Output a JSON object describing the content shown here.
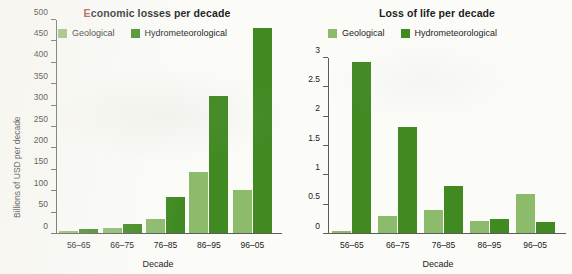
{
  "chart_data": [
    {
      "type": "bar",
      "title": "Economic losses per decade",
      "xlabel": "Decade",
      "ylabel": "Billions of USD per decade",
      "categories": [
        "56–65",
        "66–75",
        "76–85",
        "86–95",
        "96–05"
      ],
      "series": [
        {
          "name": "Geological",
          "color": "#8cbb6c",
          "values": [
            4,
            12,
            32,
            144,
            102
          ]
        },
        {
          "name": "Hydrometeorological",
          "color": "#418a22",
          "values": [
            9,
            21,
            85,
            322,
            482
          ]
        }
      ],
      "ylim": [
        0,
        500
      ],
      "ytick_values": [
        0,
        50,
        100,
        150,
        200,
        250,
        300,
        350,
        400,
        450,
        500
      ],
      "ytick_labels": [
        "0",
        "50",
        "100",
        "150",
        "200",
        "250",
        "300",
        "350",
        "400",
        "450",
        "500"
      ],
      "grid": false,
      "legend_position": "top"
    },
    {
      "type": "bar",
      "title": "Loss of life per decade",
      "xlabel": "Decade",
      "ylabel": "Millions of casualties per decade",
      "categories": [
        "56–65",
        "66–75",
        "76–85",
        "86–95",
        "96–05"
      ],
      "series": [
        {
          "name": "Geological",
          "color": "#8cbb6c",
          "values": [
            0.03,
            0.29,
            0.4,
            0.2,
            0.67
          ]
        },
        {
          "name": "Hydrometeorological",
          "color": "#418a22",
          "values": [
            2.93,
            1.81,
            0.8,
            0.24,
            0.19
          ]
        }
      ],
      "ylim": [
        0,
        3
      ],
      "ytick_values": [
        0,
        0.5,
        1,
        1.5,
        2,
        2.5,
        3
      ],
      "ytick_labels": [
        "0",
        "0.5",
        "1",
        "1.5",
        "2",
        "2.5",
        "3"
      ],
      "grid": false,
      "legend_position": "top"
    }
  ],
  "panels": {
    "left": {
      "title_lead": "E",
      "title_rest": "conomic losses per decade",
      "ylabel": "Billions of USD per decade",
      "xlabel": "Decade"
    },
    "right": {
      "title": "Loss of life per decade",
      "ylabel": "Millions of casualties per decade",
      "xlabel": "Decade"
    }
  },
  "legend": {
    "geological_label": "Geological",
    "hydrometeorological_label": "Hydrometeorological",
    "geological_color": "#8cbb6c",
    "hydrometeorological_color": "#418a22"
  }
}
